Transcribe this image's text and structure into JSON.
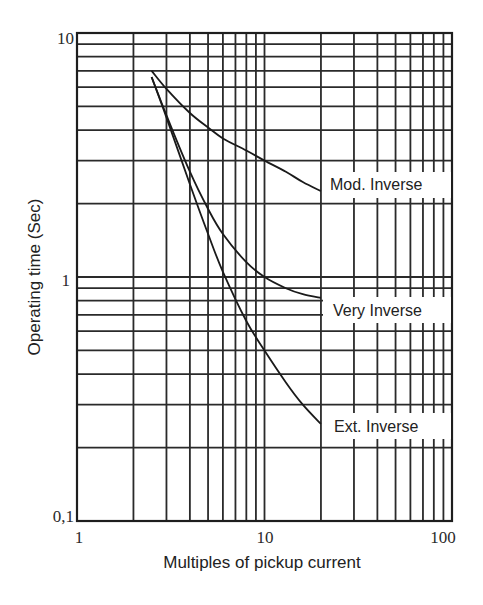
{
  "chart_data": {
    "type": "line",
    "title": "",
    "xlabel": "Multiples of pickup current",
    "ylabel": "Operating time (Sec)",
    "xscale": "log",
    "yscale": "log",
    "xlim": [
      1,
      100
    ],
    "ylim": [
      0.1,
      10
    ],
    "grid": true,
    "x_tick_labels": [
      "1",
      "10",
      "100"
    ],
    "y_tick_labels": [
      "0,1",
      "1",
      "10"
    ],
    "series": [
      {
        "name": "Mod. Inverse",
        "x": [
          2.5,
          3,
          4,
          5,
          6,
          8,
          10,
          13,
          16,
          20
        ],
        "values": [
          7.0,
          5.9,
          4.7,
          4.1,
          3.7,
          3.3,
          3.0,
          2.7,
          2.45,
          2.25
        ]
      },
      {
        "name": "Very Inverse",
        "x": [
          2.5,
          3,
          4,
          5,
          6,
          8,
          10,
          13,
          16,
          20
        ],
        "values": [
          6.6,
          4.6,
          2.7,
          1.9,
          1.5,
          1.15,
          1.0,
          0.9,
          0.85,
          0.82
        ]
      },
      {
        "name": "Ext. Inverse",
        "x": [
          2.5,
          3,
          4,
          5,
          6,
          8,
          10,
          13,
          16,
          20
        ],
        "values": [
          6.6,
          4.5,
          2.4,
          1.5,
          1.05,
          0.66,
          0.5,
          0.37,
          0.3,
          0.25
        ]
      }
    ],
    "labels": {
      "mod": "Mod. Inverse",
      "very": "Very Inverse",
      "ext": "Ext. Inverse"
    }
  }
}
